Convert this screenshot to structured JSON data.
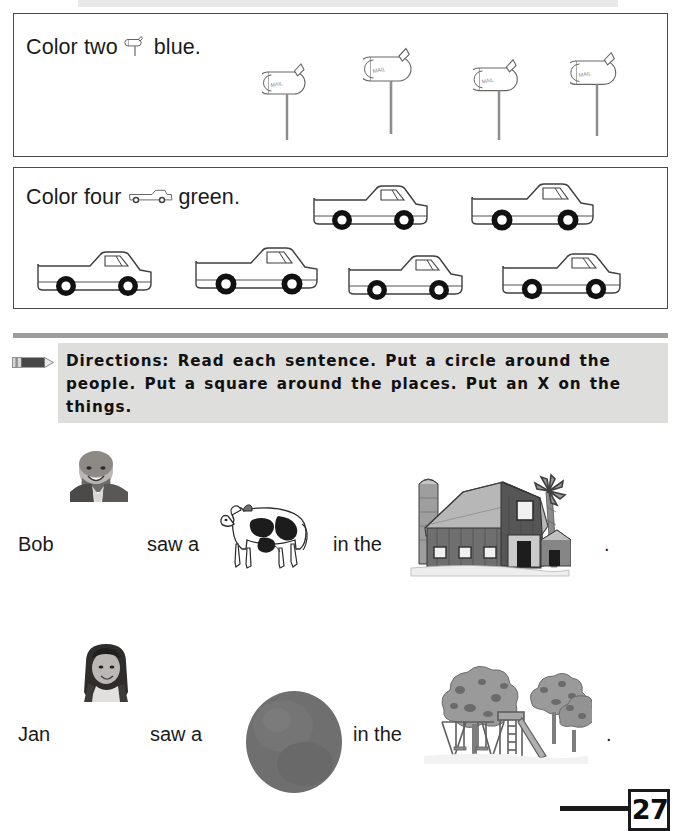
{
  "page": {
    "number": "27",
    "top_banner": "",
    "background_color": "#ffffff"
  },
  "tasks": [
    {
      "id": "mailboxes",
      "prompt_before": "Color two",
      "prompt_after": "blue.",
      "inline_icon": "mailbox-icon",
      "color_word": "blue",
      "count_word": "two",
      "count": 2,
      "item_label": "MAIL",
      "item_icon": "mailbox-icon",
      "items_total": 4,
      "items": [
        {
          "x": 262,
          "y": 56,
          "scale": 0.86
        },
        {
          "x": 363,
          "y": 40,
          "scale": 1.0
        },
        {
          "x": 473,
          "y": 52,
          "scale": 0.92
        },
        {
          "x": 570,
          "y": 45,
          "scale": 0.97
        }
      ]
    },
    {
      "id": "trucks",
      "prompt_before": "Color four",
      "prompt_after": "green.",
      "inline_icon": "pickup-truck-icon",
      "color_word": "green",
      "count_word": "four",
      "count": 4,
      "item_icon": "pickup-truck-icon",
      "items_total": 6,
      "items": [
        {
          "x": 308,
          "y": 180,
          "scale": 1.0
        },
        {
          "x": 466,
          "y": 178,
          "scale": 1.06
        },
        {
          "x": 32,
          "y": 246,
          "scale": 1.0
        },
        {
          "x": 190,
          "y": 242,
          "scale": 1.06
        },
        {
          "x": 343,
          "y": 250,
          "scale": 1.0
        },
        {
          "x": 497,
          "y": 248,
          "scale": 1.03
        }
      ]
    }
  ],
  "directions": {
    "icon": "pencil-icon",
    "text": "Directions: Read each sentence. Put a circle around the people. Put a square around the places. Put an X on the things.",
    "background_color": "#dededd",
    "rule_color": "#9d9d9d"
  },
  "sentences": [
    {
      "id": "bob",
      "name": "Bob",
      "verb": "saw a",
      "connector": "in the",
      "period": ".",
      "person_image": "boy-photo",
      "object_image": "cow-illustration",
      "place_image": "barn-illustration",
      "object_name": "cow",
      "place_name": "barn"
    },
    {
      "id": "jan",
      "name": "Jan",
      "verb": "saw a",
      "connector": "in the",
      "period": ".",
      "person_image": "girl-photo",
      "object_image": "ball-photo",
      "place_image": "playground-illustration",
      "object_name": "ball",
      "place_name": "playground"
    }
  ]
}
